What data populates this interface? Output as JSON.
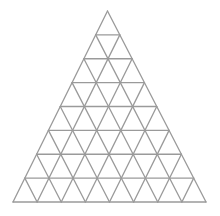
{
  "figure": {
    "subdivisions": 8,
    "small_triangle_count": 64,
    "line_color": "#9a9a9a",
    "background_color": "#ffffff"
  }
}
